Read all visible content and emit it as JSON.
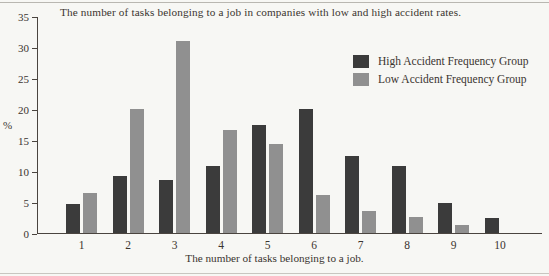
{
  "chart_data": {
    "type": "bar",
    "title": "The number of tasks belonging to a job in companies with low and high accident rates.",
    "xlabel": "The number of tasks belonging to a job.",
    "ylabel": "%",
    "categories": [
      "1",
      "2",
      "3",
      "4",
      "5",
      "6",
      "7",
      "8",
      "9",
      "10"
    ],
    "series": [
      {
        "name": "High Accident Frequency Group",
        "color": "#3b3b3b",
        "values": [
          4.7,
          9.2,
          8.5,
          10.8,
          17.4,
          20.0,
          12.4,
          10.8,
          4.9,
          2.5
        ]
      },
      {
        "name": "Low Accident Frequency Group",
        "color": "#909090",
        "values": [
          6.5,
          20.0,
          31.0,
          16.6,
          14.4,
          6.1,
          3.5,
          2.6,
          1.3,
          0
        ]
      }
    ],
    "ylim": [
      0,
      35
    ],
    "yticks": [
      0,
      5,
      10,
      15,
      20,
      25,
      30,
      35
    ],
    "ytick_labels": [
      "0",
      "5",
      "10",
      "15",
      "20",
      "25",
      "30",
      "35"
    ],
    "grid": false,
    "legend_position": "upper right"
  }
}
